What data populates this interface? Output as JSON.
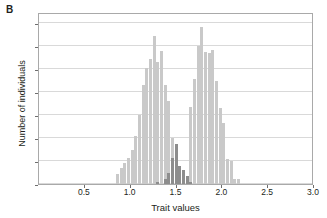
{
  "panel": {
    "label": "B"
  },
  "chart_data": {
    "type": "bar",
    "title": "",
    "subtitle": "",
    "xlabel": "Trait values",
    "ylabel": "Number of individuals",
    "xlim": [
      0.0,
      3.0
    ],
    "ylim": [
      0,
      150
    ],
    "grid": "horizontal",
    "legend": "none",
    "bin_width": 0.04,
    "xticks": [
      "0.5",
      "1.0",
      "1.5",
      "2.0",
      "2.5",
      "3.0"
    ],
    "xtick_values": [
      0.5,
      1.0,
      1.5,
      2.0,
      2.5,
      3.0
    ],
    "yticks": [
      "0",
      "20",
      "40",
      "60",
      "80",
      "100",
      "120",
      "140"
    ],
    "ytick_values": [
      0,
      20,
      40,
      60,
      80,
      100,
      120,
      140
    ],
    "colors": {
      "series_light": "#c9c9c9",
      "series_dark": "#8d8d8d",
      "gridline": "#d9d9d9",
      "axis": "#a9a9a9",
      "text": "#231f20"
    },
    "x": [
      0.86,
      0.9,
      0.94,
      0.98,
      1.02,
      1.06,
      1.1,
      1.14,
      1.18,
      1.22,
      1.26,
      1.3,
      1.34,
      1.38,
      1.42,
      1.46,
      1.5,
      1.54,
      1.58,
      1.62,
      1.66,
      1.7,
      1.74,
      1.78,
      1.82,
      1.86,
      1.9,
      1.94,
      1.98,
      2.02,
      2.06,
      2.1,
      2.14,
      2.18
    ],
    "series": [
      {
        "name": "light-gray-distribution",
        "color": "#c9c9c9",
        "values": [
          9,
          14,
          18,
          23,
          30,
          42,
          60,
          86,
          101,
          109,
          129,
          106,
          116,
          86,
          72,
          40,
          23,
          11,
          5,
          2,
          67,
          92,
          120,
          137,
          115,
          114,
          117,
          90,
          66,
          53,
          22,
          20,
          4,
          4
        ]
      },
      {
        "name": "dark-gray-overlap-distribution",
        "color": "#8d8d8d",
        "values": [
          0,
          0,
          0,
          0,
          0,
          0,
          0,
          0,
          0,
          0,
          0,
          2,
          0,
          4,
          10,
          23,
          35,
          16,
          12,
          7,
          2,
          0,
          0,
          0,
          0,
          0,
          0,
          0,
          0,
          0,
          0,
          0,
          0,
          0
        ]
      }
    ]
  }
}
